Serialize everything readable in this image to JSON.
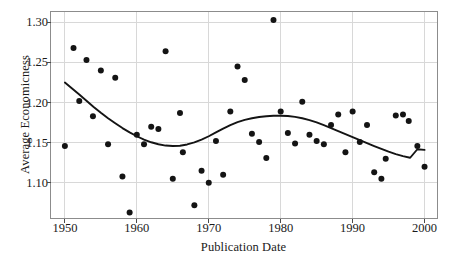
{
  "chart_data": {
    "type": "scatter",
    "title": "",
    "xlabel": "Publication Date",
    "ylabel": "Average Economicness",
    "xlim": [
      1948.0,
      2001.8
    ],
    "ylim": [
      1.0555,
      1.3135
    ],
    "xticks": [
      1950,
      1960,
      1970,
      1980,
      1990,
      2000
    ],
    "xtick_labels": [
      "1950",
      "1960",
      "1970",
      "1980",
      "1990",
      "2000"
    ],
    "yticks": [
      1.1,
      1.15,
      1.2,
      1.25,
      1.3
    ],
    "ytick_labels": [
      "1.10",
      "1.15",
      "1.20",
      "1.25",
      "1.30"
    ],
    "grid": true,
    "grid_color": "#d8d8d8",
    "frame_color": "#8c8c8c",
    "marker_color": "#141414",
    "marker_shape": "circle",
    "marker_size": 3.0,
    "legend": null,
    "series": [
      {
        "name": "Average Economicness by publication year",
        "type": "scatter",
        "points": [
          [
            1950.0,
            1.146
          ],
          [
            1951.2,
            1.268
          ],
          [
            1952.0,
            1.202
          ],
          [
            1953.0,
            1.253
          ],
          [
            1953.9,
            1.183
          ],
          [
            1955.0,
            1.24
          ],
          [
            1956.0,
            1.148
          ],
          [
            1957.0,
            1.231
          ],
          [
            1958.0,
            1.108
          ],
          [
            1959.0,
            1.063
          ],
          [
            1960.0,
            1.16
          ],
          [
            1961.0,
            1.148
          ],
          [
            1962.0,
            1.17
          ],
          [
            1963.0,
            1.167
          ],
          [
            1964.0,
            1.264
          ],
          [
            1965.0,
            1.105
          ],
          [
            1966.0,
            1.187
          ],
          [
            1966.4,
            1.138
          ],
          [
            1968.0,
            1.072
          ],
          [
            1969.0,
            1.115
          ],
          [
            1970.0,
            1.1
          ],
          [
            1971.0,
            1.152
          ],
          [
            1972.0,
            1.11
          ],
          [
            1973.0,
            1.189
          ],
          [
            1974.0,
            1.245
          ],
          [
            1975.0,
            1.228
          ],
          [
            1976.0,
            1.161
          ],
          [
            1977.0,
            1.151
          ],
          [
            1978.0,
            1.131
          ],
          [
            1979.0,
            1.303
          ],
          [
            1980.0,
            1.189
          ],
          [
            1981.0,
            1.162
          ],
          [
            1982.0,
            1.149
          ],
          [
            1983.0,
            1.201
          ],
          [
            1984.0,
            1.16
          ],
          [
            1985.0,
            1.152
          ],
          [
            1986.0,
            1.148
          ],
          [
            1987.0,
            1.172
          ],
          [
            1988.0,
            1.185
          ],
          [
            1989.0,
            1.138
          ],
          [
            1990.0,
            1.189
          ],
          [
            1991.0,
            1.151
          ],
          [
            1992.0,
            1.172
          ],
          [
            1993.0,
            1.113
          ],
          [
            1994.0,
            1.105
          ],
          [
            1994.6,
            1.13
          ],
          [
            1996.0,
            1.184
          ],
          [
            1997.0,
            1.185
          ],
          [
            1997.8,
            1.177
          ],
          [
            1999.0,
            1.146
          ],
          [
            2000.0,
            1.12
          ]
        ]
      },
      {
        "name": "Smoothed trend",
        "type": "line",
        "line_color": "#141414",
        "line_width": 1.9,
        "points": [
          [
            1950.0,
            1.225
          ],
          [
            1951.0,
            1.2175
          ],
          [
            1952.0,
            1.21
          ],
          [
            1953.0,
            1.2022
          ],
          [
            1954.0,
            1.1945
          ],
          [
            1955.0,
            1.1872
          ],
          [
            1956.0,
            1.1805
          ],
          [
            1957.0,
            1.1742
          ],
          [
            1958.0,
            1.1682
          ],
          [
            1959.0,
            1.1628
          ],
          [
            1960.0,
            1.158
          ],
          [
            1961.0,
            1.1538
          ],
          [
            1962.0,
            1.1505
          ],
          [
            1963.0,
            1.148
          ],
          [
            1964.0,
            1.1464
          ],
          [
            1965.0,
            1.1458
          ],
          [
            1966.0,
            1.1462
          ],
          [
            1967.0,
            1.1478
          ],
          [
            1968.0,
            1.1503
          ],
          [
            1969.0,
            1.1538
          ],
          [
            1970.0,
            1.158
          ],
          [
            1971.0,
            1.1628
          ],
          [
            1972.0,
            1.1675
          ],
          [
            1973.0,
            1.1718
          ],
          [
            1974.0,
            1.1755
          ],
          [
            1975.0,
            1.1785
          ],
          [
            1976.0,
            1.1805
          ],
          [
            1977.0,
            1.182
          ],
          [
            1978.0,
            1.183
          ],
          [
            1979.0,
            1.1835
          ],
          [
            1980.0,
            1.1835
          ],
          [
            1981.0,
            1.1832
          ],
          [
            1982.0,
            1.1822
          ],
          [
            1983.0,
            1.1805
          ],
          [
            1984.0,
            1.1782
          ],
          [
            1985.0,
            1.1752
          ],
          [
            1986.0,
            1.1718
          ],
          [
            1987.0,
            1.1682
          ],
          [
            1988.0,
            1.1645
          ],
          [
            1989.0,
            1.1608
          ],
          [
            1990.0,
            1.157
          ],
          [
            1991.0,
            1.1532
          ],
          [
            1992.0,
            1.1495
          ],
          [
            1993.0,
            1.1458
          ],
          [
            1994.0,
            1.1422
          ],
          [
            1995.0,
            1.1388
          ],
          [
            1996.0,
            1.1358
          ],
          [
            1997.0,
            1.1332
          ],
          [
            1998.0,
            1.1312
          ],
          [
            1999.0,
            1.1418
          ],
          [
            2000.0,
            1.141
          ]
        ]
      }
    ]
  }
}
